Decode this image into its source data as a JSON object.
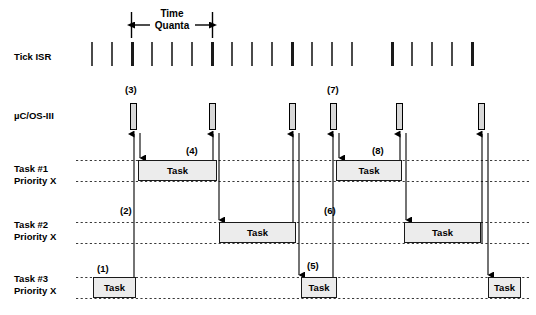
{
  "figure": {
    "type": "timing-diagram",
    "title_annotation": "Time\nQuanta",
    "rows": [
      {
        "name": "tick-isr",
        "label": "Tick ISR"
      },
      {
        "name": "uc-os-iii",
        "label": "µC/OS-III"
      },
      {
        "name": "task-1",
        "label": "Task #1\nPriority X"
      },
      {
        "name": "task-2",
        "label": "Task #2\nPriority X"
      },
      {
        "name": "task-3",
        "label": "Task #3\nPriority X"
      }
    ],
    "block_text": "Task",
    "callouts": [
      {
        "id": "1",
        "text": "(1)",
        "x": 97,
        "y": 263
      },
      {
        "id": "2",
        "text": "(2)",
        "x": 120,
        "y": 205
      },
      {
        "id": "3",
        "text": "(3)",
        "x": 125,
        "y": 84
      },
      {
        "id": "4",
        "text": "(4)",
        "x": 186,
        "y": 145
      },
      {
        "id": "5",
        "text": "(5)",
        "x": 307,
        "y": 260
      },
      {
        "id": "6",
        "text": "(6)",
        "x": 324,
        "y": 205
      },
      {
        "id": "7",
        "text": "(7)",
        "x": 327,
        "y": 84
      },
      {
        "id": "8",
        "text": "(8)",
        "x": 372,
        "y": 145
      }
    ],
    "ticks": {
      "y": 42,
      "height": 24,
      "minor": [
        92,
        112,
        152,
        172,
        192,
        232,
        252,
        272,
        312,
        332,
        352,
        412,
        432,
        452
      ],
      "major": [
        132,
        212,
        292,
        392,
        472
      ],
      "minor_width": 1.6,
      "major_width": 3
    },
    "time_quanta_bracket": {
      "x1": 131,
      "x2": 212,
      "y": 24
    },
    "os_blocks": [
      {
        "x": 130,
        "y": 103,
        "w": 7,
        "h": 27
      },
      {
        "x": 209,
        "y": 103,
        "w": 7,
        "h": 27
      },
      {
        "x": 289,
        "y": 103,
        "w": 7,
        "h": 27
      },
      {
        "x": 330,
        "y": 103,
        "w": 7,
        "h": 27
      },
      {
        "x": 396,
        "y": 103,
        "w": 7,
        "h": 27
      },
      {
        "x": 478,
        "y": 103,
        "w": 7,
        "h": 27
      }
    ],
    "task_rows": [
      {
        "row": "task-1",
        "top": 160,
        "bottom": 181,
        "blocks": [
          {
            "x": 138,
            "w": 79
          },
          {
            "x": 336,
            "w": 66
          }
        ]
      },
      {
        "row": "task-2",
        "top": 222,
        "bottom": 243,
        "blocks": [
          {
            "x": 219,
            "w": 77
          },
          {
            "x": 404,
            "w": 77
          }
        ]
      },
      {
        "row": "task-3",
        "top": 277,
        "bottom": 298,
        "blocks": [
          {
            "x": 93,
            "w": 43
          },
          {
            "x": 301,
            "w": 36
          },
          {
            "x": 488,
            "w": 33
          }
        ]
      }
    ],
    "colors": {
      "line": "#000000",
      "dashed_line": "#3a3a3a",
      "os_block_fill": "#d8d8d8",
      "task_block_fill": "#ececec",
      "background": "#ffffff"
    }
  }
}
